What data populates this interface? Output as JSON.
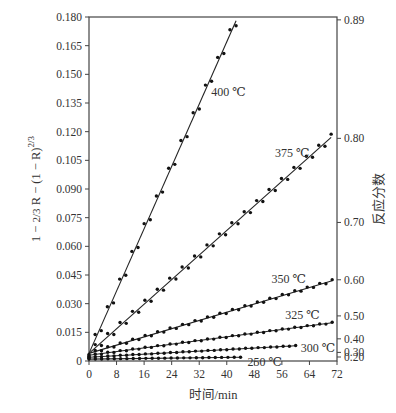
{
  "chart_data": {
    "type": "scatter",
    "title": "",
    "xlabel": "时间/min",
    "ylabel": "1-2/3R-(1-R)^2/3",
    "ylabel_right": "反应分数",
    "xlim": [
      0,
      72
    ],
    "ylim": [
      0,
      0.18
    ],
    "grid": false,
    "x_ticks": [
      0,
      8,
      16,
      24,
      32,
      40,
      48,
      56,
      64,
      72
    ],
    "y_ticks": [
      0,
      0.015,
      0.03,
      0.045,
      0.06,
      0.075,
      0.09,
      0.105,
      0.12,
      0.135,
      0.15,
      0.165,
      0.18
    ],
    "y_tick_labels": [
      "0",
      "0.015",
      "0.030",
      "0.045",
      "0.060",
      "0.075",
      "0.090",
      "0.105",
      "0.120",
      "0.135",
      "0.150",
      "0.165",
      "0.180"
    ],
    "right_axis": {
      "label": "反应分数",
      "ticks": [
        {
          "label": "0.89",
          "y": 0.1785
        },
        {
          "label": "0.80",
          "y": 0.1165
        },
        {
          "label": "0.70",
          "y": 0.0725
        },
        {
          "label": "0.60",
          "y": 0.0425
        },
        {
          "label": "0.50",
          "y": 0.0236
        },
        {
          "label": "0.40",
          "y": 0.0116
        },
        {
          "label": "0.30",
          "y": 0.0045
        },
        {
          "label": "0.20",
          "y": 0.0021
        }
      ]
    },
    "series": [
      {
        "name": "400 ℃",
        "t_end": 42.7,
        "y0": 0.004,
        "y_end": 0.178,
        "label_at": [
          35.5,
          0.141
        ]
      },
      {
        "name": "375 ℃",
        "t_end": 70.3,
        "y0": 0.004,
        "y_end": 0.117,
        "label_at": [
          54,
          0.109
        ]
      },
      {
        "name": "350 ℃",
        "t_end": 70.6,
        "y0": 0.004,
        "y_end": 0.042,
        "label_at": [
          53,
          0.043
        ]
      },
      {
        "name": "325 ℃",
        "t_end": 70.6,
        "y0": 0.003,
        "y_end": 0.02,
        "label_at": [
          57,
          0.024
        ]
      },
      {
        "name": "300 ℃",
        "t_end": 60,
        "y0": 0.002,
        "y_end": 0.008,
        "label_at": [
          61.5,
          0.007
        ]
      },
      {
        "name": "250 ℃",
        "t_end": 44,
        "y0": 0.001,
        "y_end": 0.002,
        "label_at": [
          46,
          -0.0005
        ]
      }
    ]
  }
}
